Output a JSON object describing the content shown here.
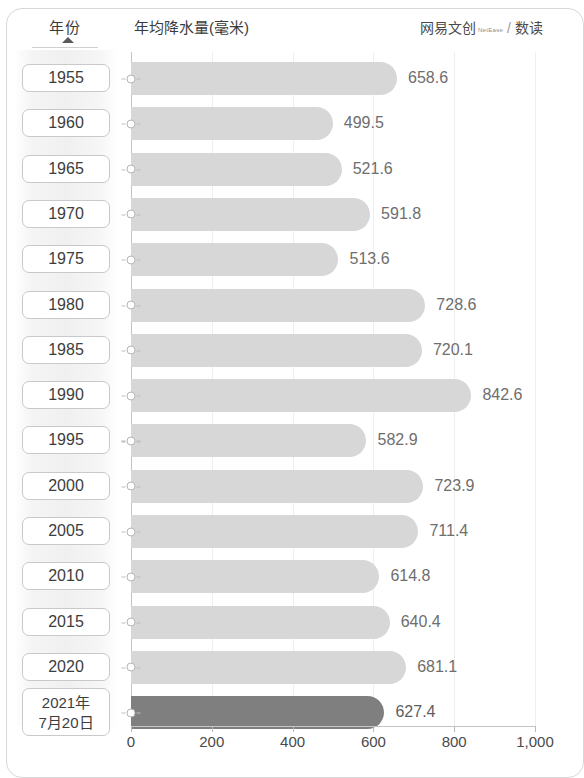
{
  "header": {
    "year_column_label": "年份",
    "chart_title": "年均降水量(毫米)",
    "credit_main": "网易文创",
    "credit_brand": "NetEase",
    "credit_slash": "/",
    "credit_sub": "数读"
  },
  "chart_data": {
    "type": "bar",
    "orientation": "horizontal",
    "title": "年均降水量(毫米)",
    "xlabel": "",
    "ylabel": "年份",
    "xlim": [
      0,
      1000
    ],
    "xticks": [
      0,
      200,
      400,
      600,
      800,
      1000
    ],
    "xtick_labels": [
      "0",
      "200",
      "400",
      "600",
      "800",
      "1,000"
    ],
    "grid": true,
    "legend": null,
    "categories": [
      "1955",
      "1960",
      "1965",
      "1970",
      "1975",
      "1980",
      "1985",
      "1990",
      "1995",
      "2000",
      "2005",
      "2010",
      "2015",
      "2020",
      "2021年\n7月20日"
    ],
    "values": [
      658.6,
      499.5,
      521.6,
      591.8,
      513.6,
      728.6,
      720.1,
      842.6,
      582.9,
      723.9,
      711.4,
      614.8,
      640.4,
      681.1,
      627.4
    ],
    "value_labels": [
      "658.6",
      "499.5",
      "521.6",
      "591.8",
      "513.6",
      "728.6",
      "720.1",
      "842.6",
      "582.9",
      "723.9",
      "711.4",
      "614.8",
      "640.4",
      "681.1",
      "627.4"
    ],
    "rows": [
      {
        "year": "1955",
        "year_line2": "",
        "value": 658.6,
        "label": "658.6",
        "highlight": false
      },
      {
        "year": "1960",
        "year_line2": "",
        "value": 499.5,
        "label": "499.5",
        "highlight": false
      },
      {
        "year": "1965",
        "year_line2": "",
        "value": 521.6,
        "label": "521.6",
        "highlight": false
      },
      {
        "year": "1970",
        "year_line2": "",
        "value": 591.8,
        "label": "591.8",
        "highlight": false
      },
      {
        "year": "1975",
        "year_line2": "",
        "value": 513.6,
        "label": "513.6",
        "highlight": false
      },
      {
        "year": "1980",
        "year_line2": "",
        "value": 728.6,
        "label": "728.6",
        "highlight": false
      },
      {
        "year": "1985",
        "year_line2": "",
        "value": 720.1,
        "label": "720.1",
        "highlight": false
      },
      {
        "year": "1990",
        "year_line2": "",
        "value": 842.6,
        "label": "842.6",
        "highlight": false
      },
      {
        "year": "1995",
        "year_line2": "",
        "value": 582.9,
        "label": "582.9",
        "highlight": false
      },
      {
        "year": "2000",
        "year_line2": "",
        "value": 723.9,
        "label": "723.9",
        "highlight": false
      },
      {
        "year": "2005",
        "year_line2": "",
        "value": 711.4,
        "label": "711.4",
        "highlight": false
      },
      {
        "year": "2010",
        "year_line2": "",
        "value": 614.8,
        "label": "614.8",
        "highlight": false
      },
      {
        "year": "2015",
        "year_line2": "",
        "value": 640.4,
        "label": "640.4",
        "highlight": false
      },
      {
        "year": "2020",
        "year_line2": "",
        "value": 681.1,
        "label": "681.1",
        "highlight": false
      },
      {
        "year": "2021年",
        "year_line2": "7月20日",
        "value": 627.4,
        "label": "627.4",
        "highlight": true
      }
    ],
    "colors": {
      "bar": "#d7d7d7",
      "bar_highlight": "#7f7f7f",
      "axis": "#c4c4c4",
      "grid": "#eeeeee",
      "text": "#4a4a4a",
      "value_text": "#6e6e6e"
    }
  }
}
